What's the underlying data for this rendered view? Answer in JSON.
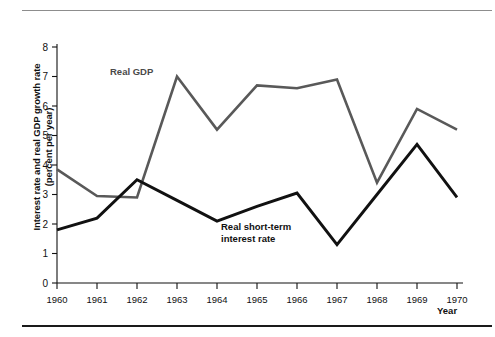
{
  "chart_data": {
    "type": "line",
    "title": "",
    "xlabel": "Year",
    "ylabel": "Interest rate and real GDP growth rate (percent per year)",
    "ylabel_line1": "Interest rate and real GDP growth rate",
    "ylabel_line2": "(percent per year)",
    "xlim": [
      1960,
      1970
    ],
    "ylim": [
      0,
      8
    ],
    "grid": false,
    "legend_position": "inline-annotation",
    "categories": [
      1960,
      1961,
      1962,
      1963,
      1964,
      1965,
      1966,
      1967,
      1968,
      1969,
      1970
    ],
    "xtick_labels": [
      "1960",
      "1961",
      "1962",
      "1963",
      "1964",
      "1965",
      "1966",
      "1967",
      "1968",
      "1969",
      "1970"
    ],
    "ytick_labels": [
      "0",
      "1",
      "2",
      "3",
      "4",
      "5",
      "6",
      "7",
      "8"
    ],
    "ytick_values": [
      0,
      1,
      2,
      3,
      4,
      5,
      6,
      7,
      8
    ],
    "series": [
      {
        "name": "Real GDP",
        "color": "#595959",
        "annotation": "Real GDP",
        "values": [
          3.85,
          2.95,
          2.9,
          7.0,
          5.2,
          6.7,
          6.6,
          6.9,
          3.4,
          5.9,
          5.2
        ]
      },
      {
        "name": "Real short-term interest rate",
        "color": "#111111",
        "annotation": "Real short-term interest rate",
        "annotation_line1": "Real short-term",
        "annotation_line2": "interest rate",
        "values": [
          1.8,
          2.2,
          3.5,
          2.8,
          2.1,
          2.6,
          3.05,
          1.3,
          3.0,
          4.7,
          2.9
        ]
      }
    ]
  },
  "figure": {
    "axis_color": "#111111",
    "background": "#ffffff",
    "top_rule_color": "#8d8d8d",
    "bottom_rule_color": "#1a1a1a"
  }
}
